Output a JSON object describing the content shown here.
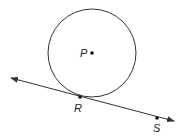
{
  "diagram": {
    "circle": {
      "center_label": "P",
      "cx": 92,
      "cy": 53,
      "r": 44
    },
    "points": [
      {
        "label": "P",
        "x": 92,
        "y": 53
      },
      {
        "label": "R",
        "x": 80,
        "y": 97
      },
      {
        "label": "S",
        "x": 157,
        "y": 118
      }
    ],
    "line": {
      "x1": 11,
      "y1": 78,
      "x2": 174,
      "y2": 121,
      "arrows": "both"
    },
    "stroke_color": "#333333"
  }
}
